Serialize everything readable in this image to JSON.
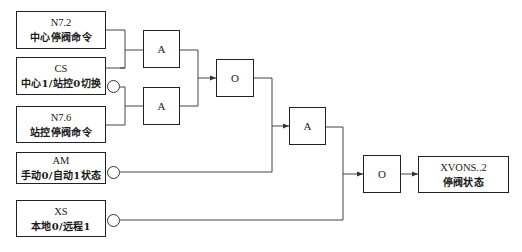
{
  "diagram": {
    "inputs": [
      {
        "id": "n72",
        "code": "N7.2",
        "desc": "中心停阀命令",
        "inverted": false
      },
      {
        "id": "cs",
        "code": "CS",
        "desc": "中心1/站控0切换",
        "inverted": true
      },
      {
        "id": "n76",
        "code": "N7.6",
        "desc": "站控停阀命令",
        "inverted": false
      },
      {
        "id": "am",
        "code": "AM",
        "desc": "手动0/自动1状态",
        "inverted": true
      },
      {
        "id": "xs",
        "code": "XS",
        "desc": "本地0/远程1",
        "inverted": true
      }
    ],
    "gates": [
      {
        "id": "and1",
        "label": "A"
      },
      {
        "id": "and2",
        "label": "A"
      },
      {
        "id": "or1",
        "label": "O"
      },
      {
        "id": "and3",
        "label": "A"
      },
      {
        "id": "or2",
        "label": "O"
      }
    ],
    "output": {
      "code": "XVONS..2",
      "desc": "停阀状态"
    },
    "colors": {
      "line": "#333333",
      "box_border": "#222222",
      "background": "#ffffff"
    }
  }
}
